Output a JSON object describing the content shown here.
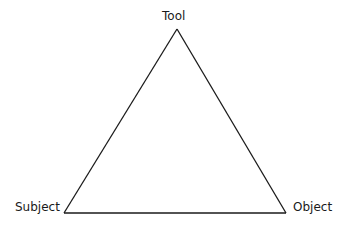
{
  "diagram": {
    "type": "triangle",
    "nodes": [
      {
        "id": "tool",
        "label": "Tool",
        "position": "top"
      },
      {
        "id": "subject",
        "label": "Subject",
        "position": "bottom-left"
      },
      {
        "id": "object",
        "label": "Object",
        "position": "bottom-right"
      }
    ],
    "edges": [
      {
        "from": "tool",
        "to": "subject"
      },
      {
        "from": "subject",
        "to": "object"
      },
      {
        "from": "object",
        "to": "tool"
      }
    ],
    "line_color": "#1a1a1a"
  }
}
